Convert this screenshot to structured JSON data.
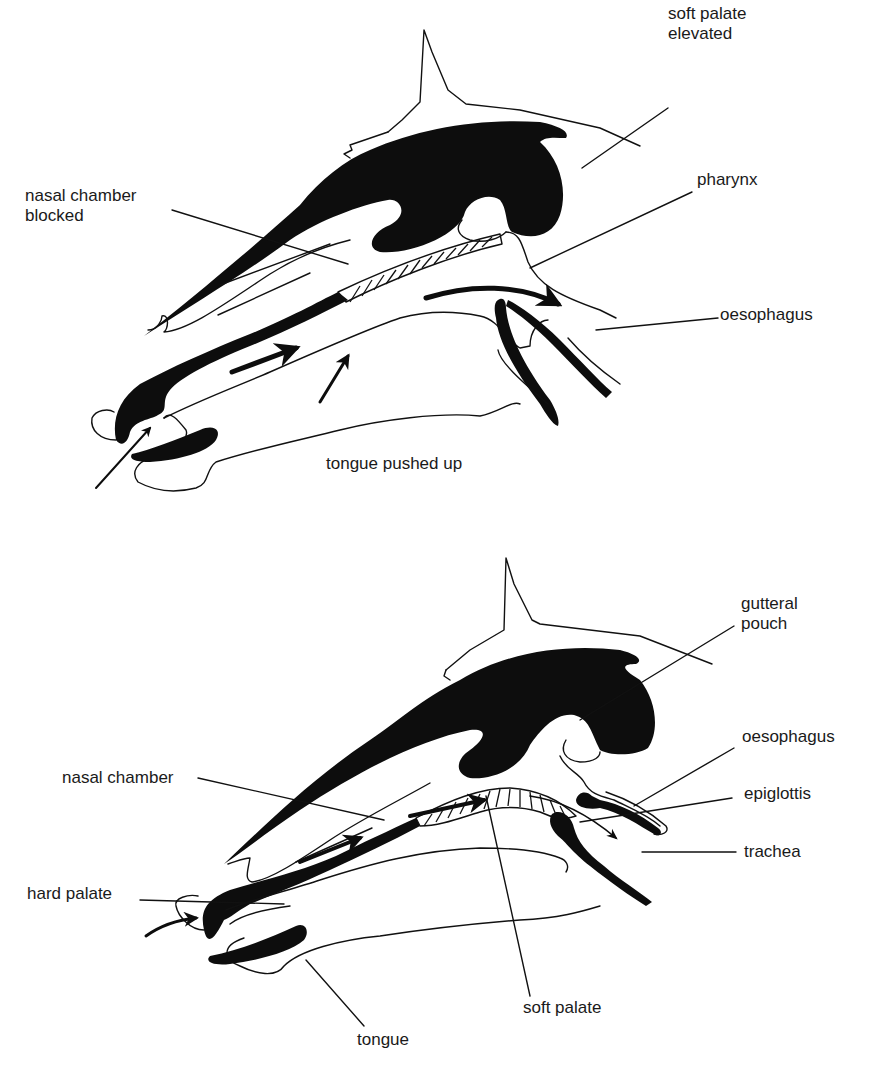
{
  "figure": {
    "panels": [
      {
        "id": "swallowing",
        "labels": {
          "soft_palate_elevated_1": "soft palate",
          "soft_palate_elevated_2": "elevated",
          "nasal_chamber_blocked_1": "nasal chamber",
          "nasal_chamber_blocked_2": "blocked",
          "pharynx": "pharynx",
          "oesophagus": "oesophagus",
          "tongue_pushed_up": "tongue pushed up"
        }
      },
      {
        "id": "breathing",
        "labels": {
          "gutteral_pouch_1": "gutteral",
          "gutteral_pouch_2": "pouch",
          "oesophagus": "oesophagus",
          "epiglottis": "epiglottis",
          "nasal_chamber": "nasal chamber",
          "trachea": "trachea",
          "hard_palate": "hard palate",
          "soft_palate": "soft palate",
          "tongue": "tongue"
        }
      }
    ]
  }
}
